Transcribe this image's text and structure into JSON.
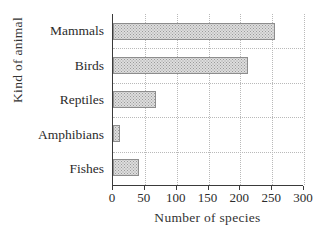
{
  "chart_data": {
    "type": "bar",
    "orientation": "horizontal",
    "title": "",
    "xlabel": "Number of species",
    "ylabel": "Kind of animal",
    "categories": [
      "Mammals",
      "Birds",
      "Reptiles",
      "Amphibians",
      "Fishes"
    ],
    "values": [
      255,
      212,
      68,
      11,
      41
    ],
    "xlim": [
      0,
      300
    ],
    "xticks": [
      0,
      50,
      100,
      150,
      200,
      250,
      300
    ],
    "xtick_labels": [
      "0",
      "50",
      "100",
      "150",
      "200",
      "250",
      "300"
    ],
    "grid": true,
    "grid_style": "dotted",
    "legend": null,
    "bar_fill": "#dddddd",
    "bar_pattern": "stippled-dots",
    "bar_border_color": "#8d8d8d",
    "axis_color": "#3a3a3a",
    "grid_color": "#b9b9b9",
    "background": "#ffffff"
  }
}
